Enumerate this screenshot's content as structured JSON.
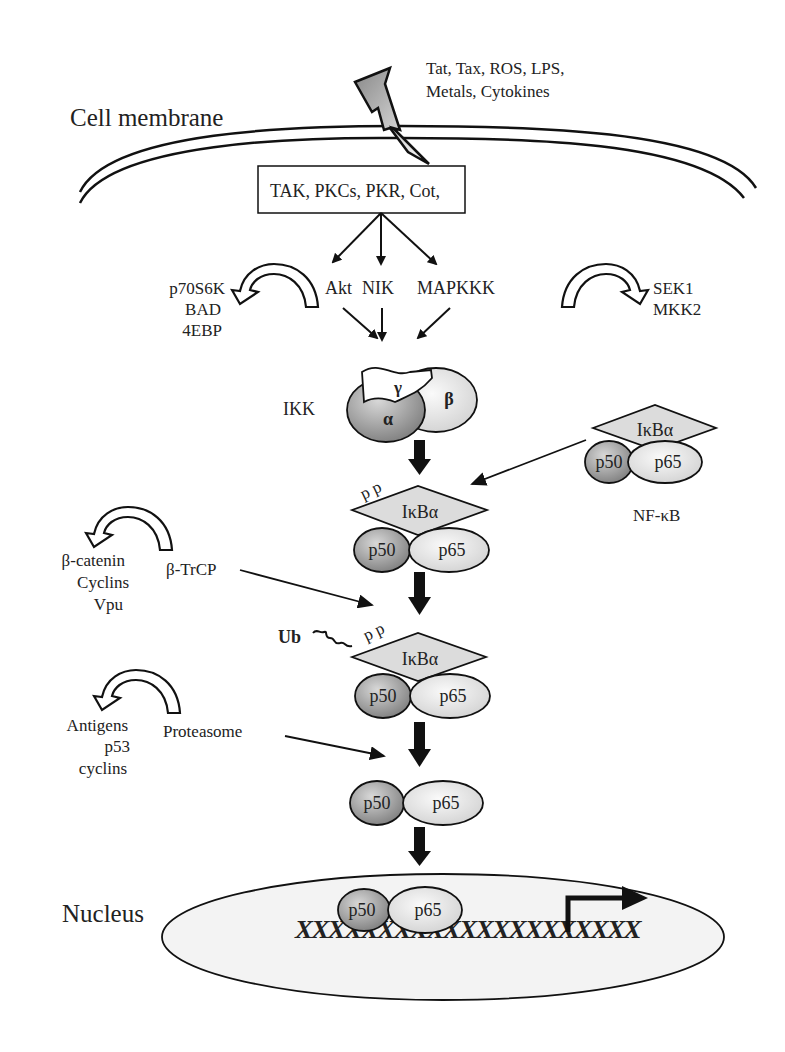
{
  "diagram": {
    "stimuli": {
      "line1": "Tat, Tax, ROS, LPS,",
      "line2": "Metals, Cytokines"
    },
    "cell_membrane_label": "Cell membrane",
    "kinase_box_label": "TAK,  PKCs, PKR, Cot,",
    "upstream_kinases": {
      "akt": "Akt",
      "nik": "NIK",
      "mapkkk": "MAPKKK"
    },
    "akt_targets": [
      "p70S6K",
      "BAD",
      "4EBP"
    ],
    "mapkkk_targets": [
      "SEK1",
      "MKK2"
    ],
    "ikk": {
      "label": "IKK",
      "alpha": "α",
      "beta": "β",
      "gamma": "γ"
    },
    "nfkb_complex": {
      "ikba": "IκBα",
      "p50": "p50",
      "p65": "p65",
      "label": "NF-κB"
    },
    "phospho_label": "p p",
    "btrcp": {
      "label": "β-TrCP",
      "targets": [
        "β-catenin",
        "Cyclins",
        "Vpu"
      ]
    },
    "ubiquitin_label": "Ub",
    "proteasome": {
      "label": "Proteasome",
      "targets": [
        "Antigens",
        "p53",
        "cyclins"
      ]
    },
    "nucleus_label": "Nucleus",
    "dna_sequence": "XXXXXXXXXXXXXXXXXXXXX",
    "colors": {
      "stroke": "#111111",
      "p50_fill": "#9a9a9a",
      "p65_fill": "#e6e6e6",
      "ikba_fill": "#dcdcdc",
      "nucleus_fill": "#f2f2f2"
    }
  }
}
